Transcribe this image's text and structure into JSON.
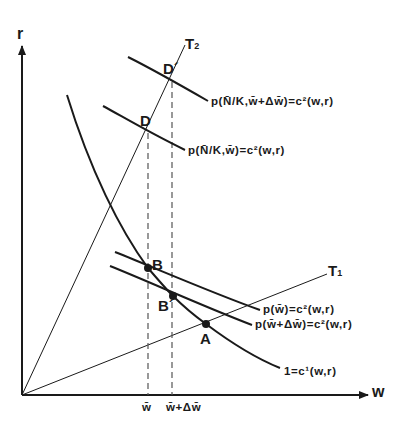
{
  "axes": {
    "x_label": "w",
    "y_label": "r"
  },
  "points": {
    "A": "A",
    "B": "B",
    "B_prime": "B´",
    "D": "D",
    "D_prime": "D´"
  },
  "rays": {
    "T1": {
      "letter": "T",
      "sub": "1"
    },
    "T2": {
      "letter": "T",
      "sub": "2"
    }
  },
  "curves": {
    "c1": "1=c¹(w,r)",
    "p_wbar": "p(w̄)=c²(w,r)",
    "p_wbar_dw": "p(w̄+Δw̄)=c²(w,r)",
    "p_NK_wbar": "p(N̄/K,w̄)=c²(w,r)",
    "p_NK_wbar_dw": "p(N̄/K,w̄+Δw̄)=c²(w,r)"
  },
  "ticks": {
    "wbar": "w̄",
    "wbar_dw": "w̄+Δw̄"
  },
  "colors": {
    "ink": "#1a1a1a",
    "dash": "#555555"
  }
}
